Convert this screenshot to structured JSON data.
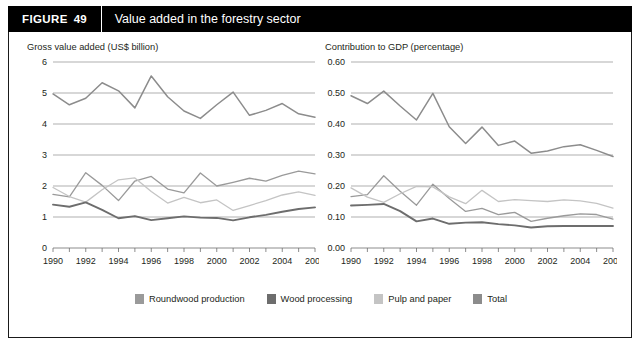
{
  "header": {
    "tag": "FIGURE",
    "number": "49",
    "title": "Value added in the forestry sector"
  },
  "legend": {
    "items": [
      {
        "label": "Roundwood production",
        "color": "#9a9a9a"
      },
      {
        "label": "Wood processing",
        "color": "#6d6d6d"
      },
      {
        "label": "Pulp and paper",
        "color": "#c4c4c4"
      },
      {
        "label": "Total",
        "color": "#8c8c8c"
      }
    ]
  },
  "chart_data": [
    {
      "type": "line",
      "panel": "left",
      "title": "Gross value added (US$ billion)",
      "xlabel": "",
      "ylabel": "Gross value added (US$ billion)",
      "x": [
        1990,
        1991,
        1992,
        1993,
        1994,
        1995,
        1996,
        1997,
        1998,
        1999,
        2000,
        2001,
        2002,
        2003,
        2004,
        2005,
        2006
      ],
      "xtick_labels": [
        "1990",
        "",
        "1992",
        "",
        "1994",
        "",
        "1996",
        "",
        "1998",
        "",
        "2000",
        "",
        "2002",
        "",
        "2004",
        "",
        "2006"
      ],
      "xlim": [
        1990,
        2006
      ],
      "ylim": [
        0,
        6
      ],
      "yticks": [
        0,
        1,
        2,
        3,
        4,
        5,
        6
      ],
      "ytick_labels": [
        "0",
        "1",
        "2",
        "3",
        "4",
        "5",
        "6"
      ],
      "grid": true,
      "legend_position": "bottom",
      "series": [
        {
          "name": "Total",
          "color": "#8c8c8c",
          "width": 1.5,
          "values": [
            4.97,
            4.62,
            4.83,
            5.33,
            5.07,
            4.52,
            5.55,
            4.88,
            4.42,
            4.18,
            4.62,
            5.03,
            4.28,
            4.44,
            4.66,
            4.33,
            4.22
          ]
        },
        {
          "name": "Roundwood production",
          "color": "#9a9a9a",
          "width": 1.3,
          "values": [
            1.73,
            1.65,
            2.43,
            2.02,
            1.53,
            2.16,
            2.31,
            1.9,
            1.78,
            2.42,
            2.0,
            2.12,
            2.25,
            2.16,
            2.34,
            2.48,
            2.39
          ]
        },
        {
          "name": "Pulp and paper",
          "color": "#c4c4c4",
          "width": 1.3,
          "values": [
            1.95,
            1.66,
            1.48,
            1.88,
            2.2,
            2.26,
            1.82,
            1.45,
            1.63,
            1.46,
            1.55,
            1.21,
            1.37,
            1.53,
            1.71,
            1.81,
            1.7
          ]
        },
        {
          "name": "Wood processing",
          "color": "#6d6d6d",
          "width": 1.9,
          "values": [
            1.4,
            1.33,
            1.47,
            1.23,
            0.96,
            1.03,
            0.9,
            0.96,
            1.02,
            0.98,
            0.97,
            0.89,
            0.99,
            1.07,
            1.17,
            1.26,
            1.31
          ]
        }
      ]
    },
    {
      "type": "line",
      "panel": "right",
      "title": "Contribution to GDP (percentage)",
      "xlabel": "",
      "ylabel": "Contribution to GDP (percentage)",
      "x": [
        1990,
        1991,
        1992,
        1993,
        1994,
        1995,
        1996,
        1997,
        1998,
        1999,
        2000,
        2001,
        2002,
        2003,
        2004,
        2005,
        2006
      ],
      "xtick_labels": [
        "1990",
        "",
        "1992",
        "",
        "1994",
        "",
        "1996",
        "",
        "1998",
        "",
        "2000",
        "",
        "2002",
        "",
        "2004",
        "",
        "2006"
      ],
      "xlim": [
        1990,
        2006
      ],
      "ylim": [
        0,
        0.6
      ],
      "yticks": [
        0,
        0.1,
        0.2,
        0.3,
        0.4,
        0.5,
        0.6
      ],
      "ytick_labels": [
        "0.00",
        "0.10",
        "0.20",
        "0.30",
        "0.40",
        "0.50",
        "0.60"
      ],
      "grid": true,
      "legend_position": "bottom",
      "series": [
        {
          "name": "Total",
          "color": "#8c8c8c",
          "width": 1.5,
          "values": [
            0.491,
            0.466,
            0.506,
            0.458,
            0.413,
            0.499,
            0.391,
            0.337,
            0.39,
            0.331,
            0.345,
            0.306,
            0.313,
            0.327,
            0.333,
            0.315,
            0.295
          ]
        },
        {
          "name": "Roundwood production",
          "color": "#9a9a9a",
          "width": 1.3,
          "values": [
            0.166,
            0.172,
            0.233,
            0.183,
            0.138,
            0.206,
            0.16,
            0.118,
            0.128,
            0.108,
            0.115,
            0.086,
            0.096,
            0.104,
            0.11,
            0.108,
            0.093
          ]
        },
        {
          "name": "Pulp and paper",
          "color": "#c4c4c4",
          "width": 1.3,
          "values": [
            0.194,
            0.164,
            0.147,
            0.175,
            0.199,
            0.197,
            0.165,
            0.143,
            0.186,
            0.15,
            0.156,
            0.153,
            0.15,
            0.155,
            0.152,
            0.144,
            0.129
          ]
        },
        {
          "name": "Wood processing",
          "color": "#6d6d6d",
          "width": 1.9,
          "values": [
            0.137,
            0.139,
            0.142,
            0.119,
            0.086,
            0.095,
            0.078,
            0.082,
            0.083,
            0.077,
            0.073,
            0.066,
            0.07,
            0.071,
            0.071,
            0.071,
            0.071
          ]
        }
      ]
    }
  ]
}
